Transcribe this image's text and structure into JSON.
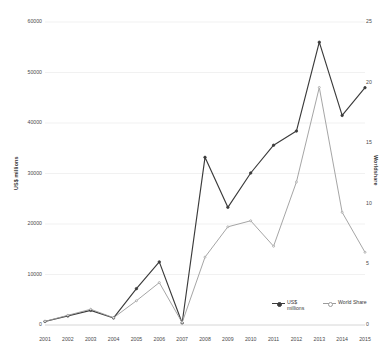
{
  "chart_data": {
    "type": "line",
    "title": "",
    "subtitle": "",
    "xlabel": "",
    "ylabel": "US$ millions",
    "y2label": "Worldshare",
    "x": [
      "2001",
      "2002",
      "2003",
      "2004",
      "2005",
      "2006",
      "2007",
      "2008",
      "2009",
      "2010",
      "2011",
      "2012",
      "2013",
      "2014",
      "2015"
    ],
    "categories": [
      "2001",
      "2002",
      "2003",
      "2004",
      "2005",
      "2006",
      "2007",
      "2008",
      "2009",
      "2010",
      "2011",
      "2012",
      "2013",
      "2014",
      "2015"
    ],
    "ylim": [
      0,
      60000
    ],
    "y2lim": [
      0,
      25
    ],
    "yticks": [
      0,
      10000,
      20000,
      30000,
      40000,
      50000,
      60000
    ],
    "y2ticks": [
      0,
      5,
      10,
      15,
      20,
      25
    ],
    "grid": true,
    "legend_position": "bottom-right",
    "series": [
      {
        "name": "US$ millions",
        "axis": "left",
        "color": "#3b3b3b",
        "marker": "circle",
        "values": [
          700,
          1800,
          2900,
          1400,
          7200,
          12500,
          400,
          33200,
          23300,
          30100,
          35600,
          38400,
          56000,
          41500,
          47000
        ]
      },
      {
        "name": "World Share",
        "axis": "right",
        "color": "#9b9b9b",
        "marker": "circle",
        "values": [
          0.3,
          0.8,
          1.3,
          0.6,
          2.0,
          3.5,
          0.2,
          5.6,
          8.1,
          8.6,
          6.5,
          11.8,
          19.6,
          9.3,
          6.0
        ]
      }
    ]
  },
  "axes": {
    "left": {
      "title": "US$ millions",
      "tick_labels": [
        "60000",
        "50000",
        "40000",
        "30000",
        "20000",
        "10000",
        "0"
      ]
    },
    "right": {
      "title": "Worldshare",
      "tick_labels": [
        "25",
        "20",
        "15",
        "10",
        "5",
        "0"
      ]
    },
    "bottom": {
      "tick_labels": [
        "2001",
        "2002",
        "2003",
        "2004",
        "2005",
        "2006",
        "2007",
        "2008",
        "2009",
        "2010",
        "2011",
        "2012",
        "2013",
        "2014",
        "2015"
      ]
    }
  },
  "legend": {
    "items": [
      {
        "label": "US$ millions",
        "color": "#3b3b3b"
      },
      {
        "label": "World Share",
        "color": "#9b9b9b"
      }
    ]
  },
  "colors": {
    "background": "#ffffff",
    "grid": "#ededed",
    "text": "#4a4a4a",
    "series_primary": "#3b3b3b",
    "series_secondary": "#9b9b9b"
  }
}
